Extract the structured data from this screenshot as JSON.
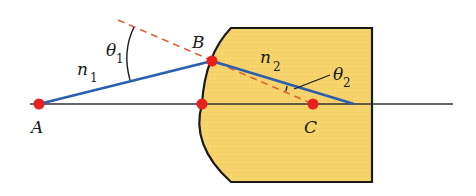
{
  "diagram": {
    "colors": {
      "lens_fill": "#f6d36a",
      "outline": "#1a1a1a",
      "ray": "#2a5fb0",
      "normal_dashed": "#e0603a",
      "point": "#e82020",
      "axis": "#333333"
    },
    "points": [
      {
        "id": "A",
        "label": "A",
        "x": 39,
        "y": 104
      },
      {
        "id": "B",
        "label": "B",
        "x": 212,
        "y": 61
      },
      {
        "id": "V",
        "label": "",
        "x": 202,
        "y": 104
      },
      {
        "id": "C",
        "label": "C",
        "x": 313,
        "y": 104
      }
    ],
    "labels": {
      "A": "A",
      "B": "B",
      "C": "C",
      "n1_main": "n",
      "n1_sub": "1",
      "n2_main": "n",
      "n2_sub": "2",
      "theta1_main": "θ",
      "theta1_sub": "1",
      "theta2_main": "θ",
      "theta2_sub": "2"
    },
    "regions": {
      "left_medium": "n1",
      "right_medium": "n2"
    }
  }
}
